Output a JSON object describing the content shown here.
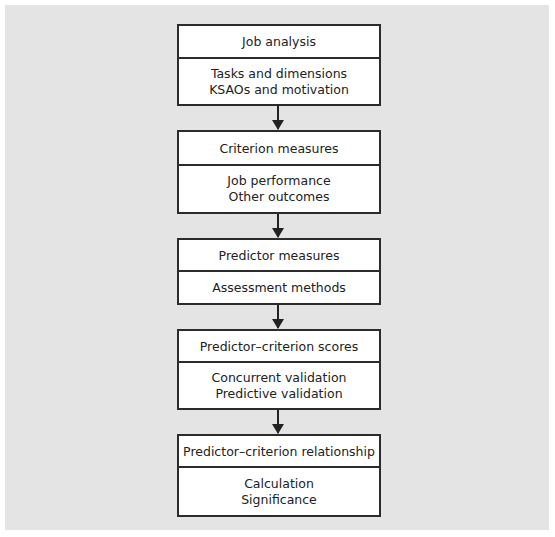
{
  "diagram": {
    "type": "flowchart",
    "steps": [
      {
        "title": "Job analysis",
        "details": [
          "Tasks and dimensions",
          "KSAOs and motivation"
        ]
      },
      {
        "title": "Criterion measures",
        "details": [
          "Job performance",
          "Other outcomes"
        ]
      },
      {
        "title": "Predictor measures",
        "details": [
          "Assessment methods"
        ]
      },
      {
        "title": "Predictor–criterion scores",
        "details": [
          "Concurrent validation",
          "Predictive validation"
        ]
      },
      {
        "title": "Predictor–criterion relationship",
        "details": [
          "Calculation",
          "Significance"
        ]
      }
    ],
    "colors": {
      "background": "#e4e4e4",
      "box": "#ffffff",
      "border": "#2b2b2b"
    }
  }
}
